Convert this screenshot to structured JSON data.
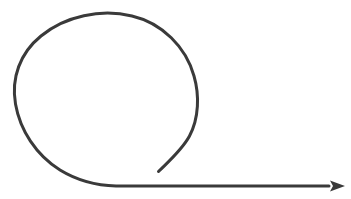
{
  "canvas": {
    "width": 351,
    "height": 199,
    "background_color": "#ffffff",
    "title": "Loop arrow"
  },
  "diagram": {
    "name": "loop-arrow",
    "description": "A single continuous line forming a large counter-clockwise loop that unwinds into a straight horizontal line ending in a solid arrowhead pointing right.",
    "stroke_color": "#3a3a3a",
    "stroke_width": 3,
    "line_cap": "round",
    "shapes": [
      {
        "id": "spiral-loop",
        "type": "path",
        "name": "spiral-loop-path",
        "d": "M 158.5 171.5 C 168 162 182 150 189.5 136 C 199 118 199.5 95 194 76 C 186 47 162 23 132 16 C 101 8.5 65 16 41 36 C 20 53 11 78 15.5 104 C 20 130 36 155 60 170 C 78 181 97 185.5 116 186 L 329 186",
        "start_point": [
          158.5,
          171.5
        ],
        "end_point": [
          329,
          186
        ],
        "loop_center": [
          106,
          99
        ],
        "loop_radius": 91,
        "baseline_y": 186
      },
      {
        "id": "arrow-head",
        "type": "polygon",
        "name": "arrowhead",
        "points": "345,186 330,180.5 333,186 330,191.5",
        "tip": [
          345,
          186
        ],
        "length": 15,
        "width": 11,
        "fill": "#3a3a3a"
      }
    ],
    "extents": {
      "loop_top_y": 14,
      "loop_left_x": 14,
      "loop_right_x": 198,
      "tail_endpoint": [
        158,
        172
      ],
      "arrow_tip_x": 345,
      "horizontal_line_y": 186
    }
  },
  "labels": []
}
